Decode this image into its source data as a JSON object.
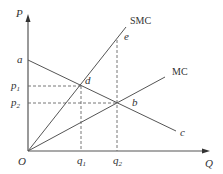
{
  "diagram": {
    "type": "economics-cost-curve-diagram",
    "colors": {
      "line": "#555555",
      "dash": "#666666",
      "text": "#333333",
      "background": "#ffffff"
    },
    "axes": {
      "y_label": "P",
      "x_label": "Q",
      "origin_label": "O"
    },
    "curves": {
      "smc": {
        "label": "SMC"
      },
      "mc": {
        "label": "MC"
      },
      "demand": {
        "start_label": "a",
        "end_label": "c"
      }
    },
    "points": {
      "d": "d",
      "b": "b",
      "e": "e"
    },
    "y_ticks": {
      "p1": {
        "base": "p",
        "sub": "1"
      },
      "p2": {
        "base": "p",
        "sub": "2"
      }
    },
    "x_ticks": {
      "q1": {
        "base": "q",
        "sub": "1"
      },
      "q2": {
        "base": "q",
        "sub": "2"
      }
    }
  }
}
